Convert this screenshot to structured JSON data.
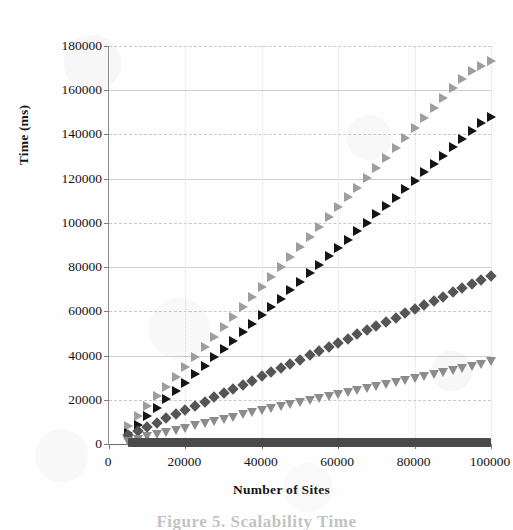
{
  "chart_data": {
    "type": "scatter",
    "title": "",
    "xlabel": "Number of Sites",
    "ylabel": "Time (ms)",
    "xlim": [
      0,
      100000
    ],
    "ylim": [
      0,
      180000
    ],
    "xticks": [
      "0",
      "20000",
      "40000",
      "60000",
      "80000",
      "100000"
    ],
    "xtick_values": [
      0,
      20000,
      40000,
      60000,
      80000,
      100000
    ],
    "yticks": [
      "0",
      "20000",
      "40000",
      "60000",
      "80000",
      "100000",
      "120000",
      "140000",
      "160000",
      "180000"
    ],
    "ytick_values": [
      0,
      20000,
      40000,
      60000,
      80000,
      100000,
      120000,
      140000,
      160000,
      180000
    ],
    "grid": true,
    "legend": "none",
    "x": [
      5000,
      7500,
      10000,
      12500,
      15000,
      17500,
      20000,
      22500,
      25000,
      27500,
      30000,
      32500,
      35000,
      37500,
      40000,
      42500,
      45000,
      47500,
      50000,
      52500,
      55000,
      57500,
      60000,
      62500,
      65000,
      67500,
      70000,
      72500,
      75000,
      77500,
      80000,
      82500,
      85000,
      87500,
      90000,
      92500,
      95000,
      97500,
      100000
    ],
    "series": [
      {
        "name": "series-1",
        "marker": "triangle-right-open",
        "color": "#9e9e9e",
        "values": [
          8000,
          12500,
          17000,
          21500,
          26000,
          30500,
          35000,
          39500,
          44000,
          48500,
          53000,
          57500,
          62000,
          66500,
          71000,
          75500,
          80000,
          84500,
          89000,
          93500,
          98000,
          102500,
          107000,
          111500,
          116000,
          120500,
          125000,
          129500,
          134000,
          138500,
          143000,
          147500,
          152000,
          156500,
          161000,
          165000,
          168500,
          171000,
          173000
        ]
      },
      {
        "name": "series-2",
        "marker": "triangle-right-filled",
        "color": "#151515",
        "values": [
          5000,
          8800,
          12600,
          16400,
          20200,
          24000,
          27800,
          31600,
          35400,
          39200,
          43000,
          46800,
          50600,
          54400,
          58200,
          62000,
          65800,
          69600,
          73400,
          77200,
          81000,
          84800,
          88600,
          92400,
          96200,
          100000,
          103800,
          107600,
          111400,
          115200,
          119000,
          122800,
          126600,
          130400,
          134200,
          138000,
          141500,
          145000,
          148000
        ]
      },
      {
        "name": "series-3",
        "marker": "diamond-filled",
        "color": "#555555",
        "values": [
          4000,
          5900,
          7800,
          9700,
          11600,
          13500,
          15400,
          17300,
          19200,
          21100,
          23000,
          24900,
          26800,
          28700,
          30600,
          32500,
          34400,
          36300,
          38200,
          40100,
          42000,
          43900,
          45800,
          47700,
          49600,
          51500,
          53400,
          55300,
          57200,
          59100,
          61000,
          62900,
          64800,
          66700,
          68600,
          70500,
          72400,
          74300,
          76000
        ]
      },
      {
        "name": "series-4",
        "marker": "triangle-down",
        "color": "#8c8c8c",
        "values": [
          1500,
          2400,
          3400,
          4400,
          5400,
          6400,
          7400,
          8400,
          9400,
          10400,
          11400,
          12400,
          13400,
          14400,
          15400,
          16400,
          17400,
          18300,
          19200,
          20100,
          21000,
          21900,
          22800,
          23700,
          24600,
          25500,
          26400,
          27300,
          28200,
          29100,
          30000,
          30900,
          31800,
          32700,
          33600,
          34500,
          35400,
          36300,
          37500
        ]
      },
      {
        "name": "series-5",
        "marker": "square-filled-band",
        "color": "#4a4a4a",
        "values": [
          300,
          300,
          320,
          320,
          340,
          340,
          360,
          360,
          380,
          380,
          400,
          400,
          420,
          420,
          440,
          440,
          460,
          460,
          480,
          480,
          500,
          500,
          520,
          520,
          540,
          540,
          560,
          560,
          580,
          580,
          600,
          600,
          620,
          620,
          640,
          640,
          660,
          660,
          700
        ]
      }
    ]
  },
  "caption": {
    "text": "Figure 5. Scalability Time"
  }
}
